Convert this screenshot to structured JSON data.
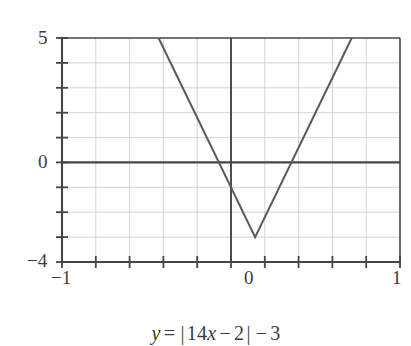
{
  "figure": {
    "name": "absolute-value-function-graph",
    "caption_parts": {
      "y": "y",
      "equals": "=",
      "bar_open": "|",
      "coefficient": "14",
      "x": "x",
      "minus_inner": "−",
      "inner_constant": "2",
      "bar_close": "|",
      "minus_outer": "−",
      "outer_constant": "3"
    },
    "caption_text": "y = |14x − 2| − 3"
  },
  "axes": {
    "x_labels": [
      "−1",
      "0",
      "1"
    ],
    "y_labels": [
      "5",
      "0",
      "−4"
    ]
  },
  "colors": {
    "background": "#ffffff",
    "axis": "#454545",
    "grid": "#c9c9c9",
    "curve": "#5a5a5a",
    "text": "#3c3c3c"
  },
  "chart_data": {
    "type": "line",
    "title": "",
    "subtitle": "",
    "annotation": "y = |14x − 2| − 3",
    "xlabel": "",
    "ylabel": "",
    "xlim": [
      -1,
      1
    ],
    "ylim": [
      -4,
      5
    ],
    "xticks": [
      -1,
      -0.8,
      -0.6,
      -0.4,
      -0.2,
      0,
      0.2,
      0.4,
      0.6,
      0.8,
      1
    ],
    "xtick_labels": [
      "−1",
      "",
      "",
      "",
      "",
      "0",
      "",
      "",
      "",
      "",
      "1"
    ],
    "yticks": [
      -4,
      -3,
      -2,
      -1,
      0,
      1,
      2,
      3,
      4,
      5
    ],
    "ytick_labels": [
      "−4",
      "",
      "",
      "",
      "0",
      "",
      "",
      "",
      "",
      "5"
    ],
    "grid": true,
    "grid_x_step": 0.2,
    "grid_y_step": 1,
    "legend": false,
    "legend_position": "none",
    "series": [
      {
        "name": "y = |14x - 2| - 3",
        "equation": "y = abs(14*x - 2) - 3",
        "vertex": [
          0.142857,
          -3
        ],
        "x_intercepts": [
          -0.071429,
          0.357143
        ],
        "clipped_to_ylim": true,
        "points": [
          [
            -0.428571,
            5
          ],
          [
            0.142857,
            -3
          ],
          [
            0.714286,
            5
          ]
        ],
        "visible_x_range": [
          -0.428571,
          0.714286
        ]
      }
    ]
  }
}
